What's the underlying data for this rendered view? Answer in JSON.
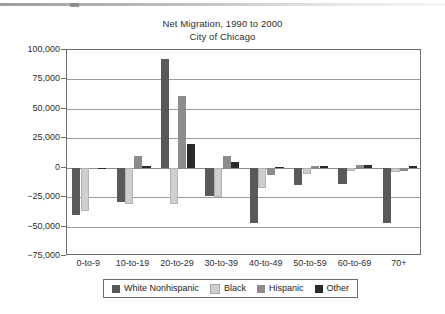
{
  "chart_data": {
    "type": "bar",
    "title": "Net Migration, 1990 to 2000",
    "subtitle": "City of Chicago",
    "xlabel": "",
    "ylabel": "",
    "ylim": [
      -75000,
      100000
    ],
    "ytick_step": 25000,
    "grid": true,
    "legend_position": "bottom",
    "orientation": "vertical-grouped",
    "categories": [
      "0-to-9",
      "10-to-19",
      "20-to-29",
      "30-to-39",
      "40-to-49",
      "50-to-59",
      "60-to-69",
      "70+"
    ],
    "ytick_labels": [
      "100,000",
      "75,000",
      "50,000",
      "25,000",
      "0",
      "-25,000",
      "-50,000",
      "-75,000"
    ],
    "ytick_values": [
      100000,
      75000,
      50000,
      25000,
      0,
      -25000,
      -50000,
      -75000
    ],
    "series": [
      {
        "name": "White Nonhispanic",
        "color": "#595959",
        "values": [
          -40000,
          -29000,
          92000,
          -24000,
          -47000,
          -15000,
          -14000,
          -47000
        ]
      },
      {
        "name": "Black",
        "color": "#cfcfcf",
        "values": [
          -37000,
          -31000,
          -31000,
          -25000,
          -17000,
          -5000,
          -3000,
          -4000
        ]
      },
      {
        "name": "Hispanic",
        "color": "#8c8c8c",
        "values": [
          -1500,
          10000,
          61000,
          10000,
          -6000,
          1500,
          2000,
          -3000
        ]
      },
      {
        "name": "Other",
        "color": "#2a2a2a",
        "values": [
          -1000,
          1500,
          20000,
          5000,
          1000,
          1500,
          2500,
          1500
        ]
      }
    ]
  }
}
